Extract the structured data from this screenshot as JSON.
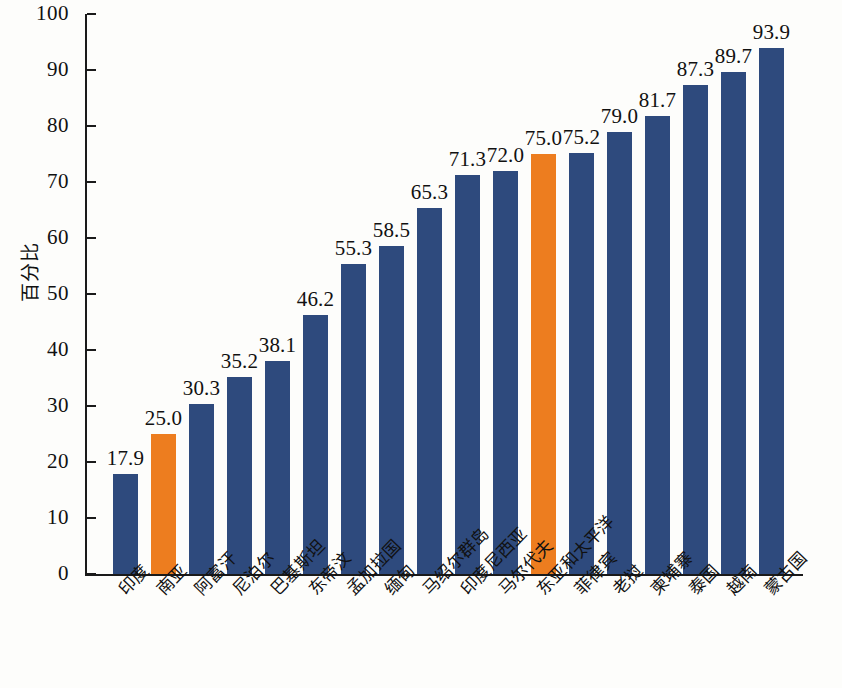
{
  "chart_data": {
    "type": "bar",
    "title": "",
    "subtitle": "",
    "xlabel": "",
    "ylabel": "百分比",
    "ylim": [
      0,
      100
    ],
    "ytick_values": [
      0,
      10,
      20,
      30,
      40,
      50,
      60,
      70,
      80,
      90,
      100
    ],
    "ytick_labels": [
      "0",
      "10",
      "20",
      "30",
      "40",
      "50",
      "60",
      "70",
      "80",
      "90",
      "100"
    ],
    "grid": false,
    "legend": null,
    "legend_position": "none",
    "categories": [
      "印度",
      "南亚",
      "阿富汗",
      "尼泊尔",
      "巴基斯坦",
      "东帝汶",
      "孟加拉国",
      "缅甸",
      "马绍尔群岛",
      "印度尼西亚",
      "马尔代夫",
      "东亚和太平洋",
      "菲律宾",
      "老挝",
      "柬埔寨",
      "泰国",
      "越南",
      "蒙古国"
    ],
    "values": [
      17.9,
      25.0,
      30.3,
      35.2,
      38.1,
      46.2,
      55.3,
      58.5,
      65.3,
      71.3,
      72.0,
      75.0,
      75.2,
      79.0,
      81.7,
      87.3,
      89.7,
      93.9
    ],
    "value_labels": [
      "17.9",
      "25.0",
      "30.3",
      "35.2",
      "38.1",
      "46.2",
      "55.3",
      "58.5",
      "65.3",
      "71.3",
      "72.0",
      "75.0",
      "75.2",
      "79.0",
      "81.7",
      "87.3",
      "89.7",
      "93.9"
    ],
    "bar_colors": [
      "#2e4a7d",
      "#ed7d1f",
      "#2e4a7d",
      "#2e4a7d",
      "#2e4a7d",
      "#2e4a7d",
      "#2e4a7d",
      "#2e4a7d",
      "#2e4a7d",
      "#2e4a7d",
      "#2e4a7d",
      "#ed7d1f",
      "#2e4a7d",
      "#2e4a7d",
      "#2e4a7d",
      "#2e4a7d",
      "#2e4a7d",
      "#2e4a7d"
    ],
    "highlight_color": "#ed7d1f",
    "series_color": "#2e4a7d",
    "highlighted_categories": [
      "南亚",
      "东亚和太平洋"
    ],
    "axis_color": "#1a1a1a",
    "background_color": "#fdfdfb"
  }
}
